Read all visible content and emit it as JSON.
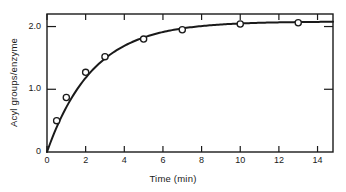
{
  "chart_data": {
    "type": "line",
    "title": "",
    "xlabel": "Time  (min)",
    "ylabel": "Acyl groups/enzyme",
    "xlim": [
      0,
      14.8
    ],
    "ylim": [
      0,
      2.2
    ],
    "xticks": [
      0,
      2,
      4,
      6,
      8,
      10,
      12,
      14
    ],
    "xticklabels": [
      "0",
      "2",
      "4",
      "6",
      "8",
      "10",
      "12",
      "14"
    ],
    "yticks": [
      0,
      1.0,
      2.0
    ],
    "yticklabels": [
      "0",
      "1.0",
      "2.0"
    ],
    "grid": false,
    "legend": null,
    "marker": "open-circle",
    "line_color": "#1a1a1a",
    "marker_face_color": "#ffffff",
    "series": [
      {
        "name": "Acyl groups per enzyme",
        "x": [
          0,
          0.5,
          1.0,
          2.0,
          3.0,
          5.0,
          7.0,
          10.0,
          13.0
        ],
        "y": [
          0.0,
          0.5,
          0.87,
          1.27,
          1.52,
          1.8,
          1.95,
          2.04,
          2.06
        ],
        "marker_x": [
          0.5,
          1.0,
          2.0,
          3.0,
          5.0,
          7.0,
          10.0,
          13.0
        ],
        "marker_y": [
          0.5,
          0.87,
          1.27,
          1.52,
          1.8,
          1.95,
          2.04,
          2.06
        ],
        "curve_model": "saturating_exponential",
        "plateau": 2.08,
        "rate_constant": 0.42
      }
    ]
  },
  "axes": {
    "x_title": "Time  (min)",
    "y_title": "Acyl groups/enzyme",
    "x_tick_labels": [
      "0",
      "2",
      "4",
      "6",
      "8",
      "10",
      "12",
      "14"
    ],
    "y_tick_labels": [
      "0",
      "1.0",
      "2.0"
    ]
  },
  "colors": {
    "frame": "#1a1a1a",
    "curve": "#1a1a1a",
    "marker_fill": "#ffffff",
    "background": "#ffffff",
    "text": "#1a1a1a"
  }
}
